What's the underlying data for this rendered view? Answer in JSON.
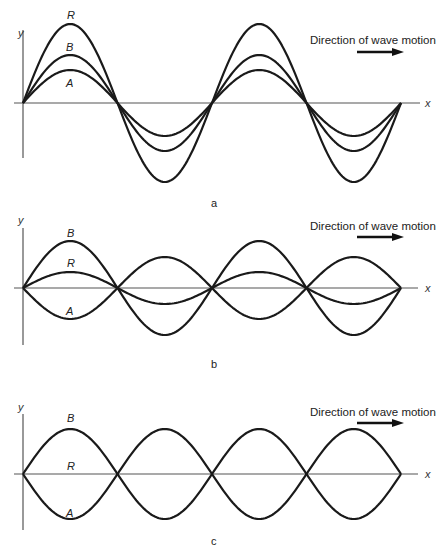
{
  "figure": {
    "panels": [
      {
        "id": "a",
        "label": "a",
        "axes": {
          "x_label": "x",
          "y_label": "y"
        },
        "direction_text": "Direction of wave motion",
        "description": "Two waves A and B in phase; resultant R has the sum amplitude",
        "curves": [
          {
            "name": "R",
            "label": "R",
            "amplitude": 79
          },
          {
            "name": "B",
            "label": "B",
            "amplitude": 48
          },
          {
            "name": "A",
            "label": "A",
            "amplitude": 33
          }
        ]
      },
      {
        "id": "b",
        "label": "b",
        "axes": {
          "x_label": "x",
          "y_label": "y"
        },
        "direction_text": "Direction of wave motion",
        "description": "Two waves A and B out of phase with unequal amplitudes; small resultant R",
        "curves": [
          {
            "name": "B",
            "label": "B",
            "amplitude": 47
          },
          {
            "name": "R",
            "label": "R",
            "amplitude": 16
          },
          {
            "name": "A",
            "label": "A",
            "amplitude": -31
          }
        ]
      },
      {
        "id": "c",
        "label": "c",
        "axes": {
          "x_label": "x",
          "y_label": "y"
        },
        "direction_text": "Direction of wave motion",
        "description": "Two waves A and B exactly out of phase with equal amplitude; resultant R is zero",
        "curves": [
          {
            "name": "B",
            "label": "B",
            "amplitude": 45
          },
          {
            "name": "R",
            "label": "R",
            "amplitude": 0
          },
          {
            "name": "A",
            "label": "A",
            "amplitude": -45
          }
        ]
      }
    ]
  },
  "chart_data": [
    {
      "type": "line",
      "title": "a",
      "xlabel": "x",
      "ylabel": "y",
      "annotation": "Direction of wave motion",
      "half_periods": 4,
      "series": [
        {
          "name": "R",
          "amplitude": 79
        },
        {
          "name": "B",
          "amplitude": 48
        },
        {
          "name": "A",
          "amplitude": 33
        }
      ]
    },
    {
      "type": "line",
      "title": "b",
      "xlabel": "x",
      "ylabel": "y",
      "annotation": "Direction of wave motion",
      "half_periods": 4,
      "series": [
        {
          "name": "B",
          "amplitude": 47
        },
        {
          "name": "R",
          "amplitude": 16
        },
        {
          "name": "A",
          "amplitude": -31
        }
      ]
    },
    {
      "type": "line",
      "title": "c",
      "xlabel": "x",
      "ylabel": "y",
      "annotation": "Direction of wave motion",
      "half_periods": 4,
      "series": [
        {
          "name": "B",
          "amplitude": 45
        },
        {
          "name": "R",
          "amplitude": 0
        },
        {
          "name": "A",
          "amplitude": -45
        }
      ]
    }
  ]
}
